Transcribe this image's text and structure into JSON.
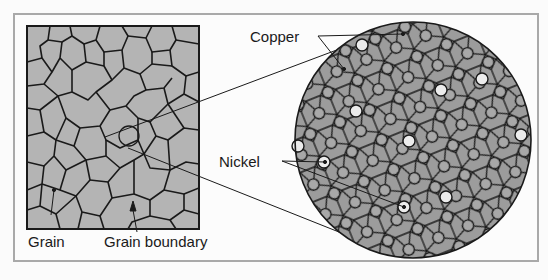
{
  "figure": {
    "colors": {
      "background": "#fcfcfc",
      "frame": "#a9a9a9",
      "grain_fill": "#b4b4b4",
      "lattice_fill": "#9c9c9c",
      "copper_atom": "#a8a8a8",
      "nickel_atom": "#ececec",
      "lines": "#1a1a1a"
    },
    "labels": {
      "grain": "Grain",
      "grain_boundary": "Grain boundary",
      "copper": "Copper",
      "nickel": "Nickel"
    },
    "panels": [
      {
        "name": "microstructure",
        "description": "Magnified view of metal showing irregular grains separated by grain boundaries, with a small circled region"
      },
      {
        "name": "atomic-view",
        "description": "Circular enlargement of the circled region showing atoms arranged in a lattice; copper atoms (grey) and nickel atoms (white)"
      }
    ]
  }
}
